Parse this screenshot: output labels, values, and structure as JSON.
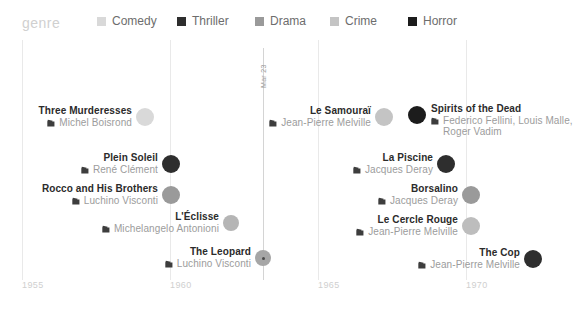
{
  "legend": {
    "title": "genre",
    "items": [
      {
        "label": "Comedy",
        "color": "#d9d9d9",
        "name": "legend-item-comedy"
      },
      {
        "label": "Thriller",
        "color": "#2e2e2e",
        "name": "legend-item-thriller"
      },
      {
        "label": "Drama",
        "color": "#9a9a9a",
        "name": "legend-item-drama"
      },
      {
        "label": "Crime",
        "color": "#c4c4c4",
        "name": "legend-item-crime"
      },
      {
        "label": "Horror",
        "color": "#1c1c1c",
        "name": "legend-item-horror"
      }
    ]
  },
  "axis": {
    "ticks": [
      "1955",
      "1960",
      "1965",
      "1970"
    ],
    "tick_x": [
      22,
      170,
      318,
      466
    ],
    "gridline_x": [
      22,
      170,
      318,
      466
    ]
  },
  "tracker": {
    "x": 263,
    "label": "Mar 23"
  },
  "chart_data": {
    "type": "scatter",
    "title": "genre",
    "xlabel": "",
    "ylabel": "",
    "xlim": [
      1955,
      1972
    ],
    "grid": true,
    "legend_position": "top",
    "points": [
      {
        "title": "Three Murderesses",
        "director": "Michel Boisrond",
        "director2": "",
        "genre": "Comedy",
        "color": "#d9d9d9",
        "cx": 145,
        "cy": 117,
        "r": 9,
        "label_side": "left",
        "selected": false
      },
      {
        "title": "Plein Soleil",
        "director": "René Clément",
        "director2": "",
        "genre": "Thriller",
        "color": "#2e2e2e",
        "cx": 171,
        "cy": 164,
        "r": 9,
        "label_side": "left",
        "selected": false
      },
      {
        "title": "Rocco and His Brothers",
        "director": "Luchino Visconti",
        "director2": "",
        "genre": "Drama",
        "color": "#9a9a9a",
        "cx": 171,
        "cy": 195,
        "r": 9,
        "label_side": "left",
        "selected": false
      },
      {
        "title": "L'Éclisse",
        "director": "Michelangelo Antonioni",
        "director2": "",
        "genre": "Drama",
        "color": "#b5b5b5",
        "cx": 231,
        "cy": 223,
        "r": 8,
        "label_side": "left",
        "selected": false
      },
      {
        "title": "The Leopard",
        "director": "Luchino Visconti",
        "director2": "",
        "genre": "Drama",
        "color": "#a6a6a6",
        "cx": 263,
        "cy": 258,
        "r": 8,
        "label_side": "left",
        "selected": true
      },
      {
        "title": "Le Samouraï",
        "director": "Jean-Pierre Melville",
        "director2": "",
        "genre": "Crime",
        "color": "#c4c4c4",
        "cx": 384,
        "cy": 117,
        "r": 9,
        "label_side": "left",
        "selected": false
      },
      {
        "title": "Spirits of the Dead",
        "director": "Federico Fellini, Louis Malle,",
        "director2": "Roger Vadim",
        "genre": "Horror",
        "color": "#1c1c1c",
        "cx": 417,
        "cy": 115,
        "r": 9,
        "label_side": "right",
        "selected": false
      },
      {
        "title": "La Piscine",
        "director": "Jacques Deray",
        "director2": "",
        "genre": "Thriller",
        "color": "#2e2e2e",
        "cx": 446,
        "cy": 164,
        "r": 9,
        "label_side": "left",
        "selected": false
      },
      {
        "title": "Borsalino",
        "director": "Jacques Deray",
        "director2": "",
        "genre": "Drama",
        "color": "#9a9a9a",
        "cx": 471,
        "cy": 195,
        "r": 9,
        "label_side": "left",
        "selected": false
      },
      {
        "title": "Le Cercle Rouge",
        "director": "Jean-Pierre Melville",
        "director2": "",
        "genre": "Crime",
        "color": "#bdbdbd",
        "cx": 471,
        "cy": 226,
        "r": 9,
        "label_side": "left",
        "selected": false
      },
      {
        "title": "The Cop",
        "director": "Jean-Pierre Melville",
        "director2": "",
        "genre": "Thriller",
        "color": "#2e2e2e",
        "cx": 533,
        "cy": 259,
        "r": 9,
        "label_side": "left",
        "selected": false
      }
    ]
  }
}
